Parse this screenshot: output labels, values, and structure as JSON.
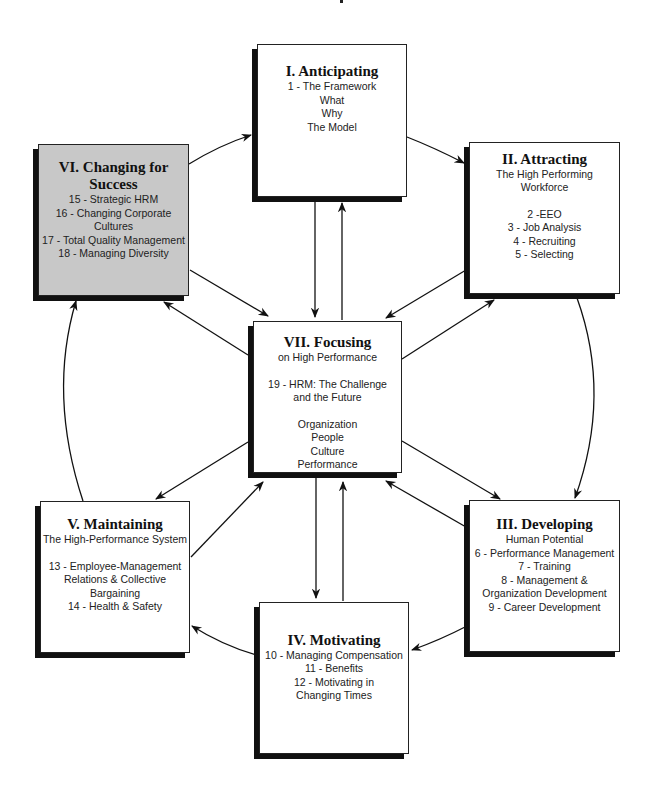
{
  "diagram": {
    "type": "cycle-hub-diagram",
    "center": {
      "id": "VII",
      "title": "VII. Focusing",
      "lines": [
        "on High Performance",
        "",
        "19 - HRM: The Challenge",
        "and the Future",
        "",
        "Organization",
        "People",
        "Culture",
        "Performance"
      ]
    },
    "nodes": [
      {
        "id": "I",
        "title": "I. Anticipating",
        "lines": [
          "1 - The Framework",
          "What",
          "Why",
          "The Model"
        ],
        "fill": "#ffffff"
      },
      {
        "id": "II",
        "title": "II. Attracting",
        "lines": [
          "The High Performing",
          "Workforce",
          "",
          "2 -EEO",
          "3 - Job Analysis",
          "4 - Recruiting",
          "5 - Selecting"
        ],
        "fill": "#ffffff"
      },
      {
        "id": "III",
        "title": "III. Developing",
        "lines": [
          "Human Potential",
          "6 - Performance Management",
          "7 - Training",
          "8 - Management &",
          "Organization Development",
          "9 - Career Development"
        ],
        "fill": "#ffffff"
      },
      {
        "id": "IV",
        "title": "IV. Motivating",
        "lines": [
          "10 - Managing Compensation",
          "11 -  Benefits",
          "12 - Motivating in",
          "Changing Times"
        ],
        "fill": "#ffffff"
      },
      {
        "id": "V",
        "title": "V. Maintaining",
        "lines": [
          "The High-Performance System",
          "",
          "13 - Employee-Management",
          "Relations & Collective",
          "Bargaining",
          "14 - Health & Safety"
        ],
        "fill": "#ffffff"
      },
      {
        "id": "VI",
        "title_lines": [
          "VI. Changing for",
          "Success"
        ],
        "lines": [
          "15 - Strategic HRM",
          "16 - Changing Corporate",
          "Cultures",
          "17 - Total Quality Management",
          "18 - Managing Diversity"
        ],
        "fill": "#c8c8c8"
      }
    ],
    "edges": [
      {
        "from": "VI",
        "to": "I",
        "style": "arrow"
      },
      {
        "from": "I",
        "to": "II",
        "style": "arrow"
      },
      {
        "from": "II",
        "to": "III",
        "style": "curved-arrow"
      },
      {
        "from": "III",
        "to": "IV",
        "style": "curved-arrow"
      },
      {
        "from": "IV",
        "to": "V",
        "style": "curved-arrow"
      },
      {
        "from": "V",
        "to": "VI",
        "style": "curved-arrow"
      },
      {
        "from": "I",
        "to": "VII",
        "style": "arrow"
      },
      {
        "from": "VII",
        "to": "I",
        "style": "arrow"
      },
      {
        "from": "VI",
        "to": "VII",
        "style": "arrow"
      },
      {
        "from": "VII",
        "to": "VI",
        "style": "arrow"
      },
      {
        "from": "II",
        "to": "VII",
        "style": "arrow"
      },
      {
        "from": "VII",
        "to": "II",
        "style": "arrow"
      },
      {
        "from": "VII",
        "to": "III",
        "style": "arrow"
      },
      {
        "from": "III",
        "to": "VII",
        "style": "arrow"
      },
      {
        "from": "VII",
        "to": "IV",
        "style": "arrow"
      },
      {
        "from": "IV",
        "to": "VII",
        "style": "arrow"
      },
      {
        "from": "VII",
        "to": "V",
        "style": "arrow"
      },
      {
        "from": "V",
        "to": "VII",
        "style": "arrow"
      }
    ],
    "colors": {
      "box_fill": "#ffffff",
      "highlight_fill": "#c8c8c8",
      "stroke": "#111111",
      "shadow": "#111111"
    }
  }
}
